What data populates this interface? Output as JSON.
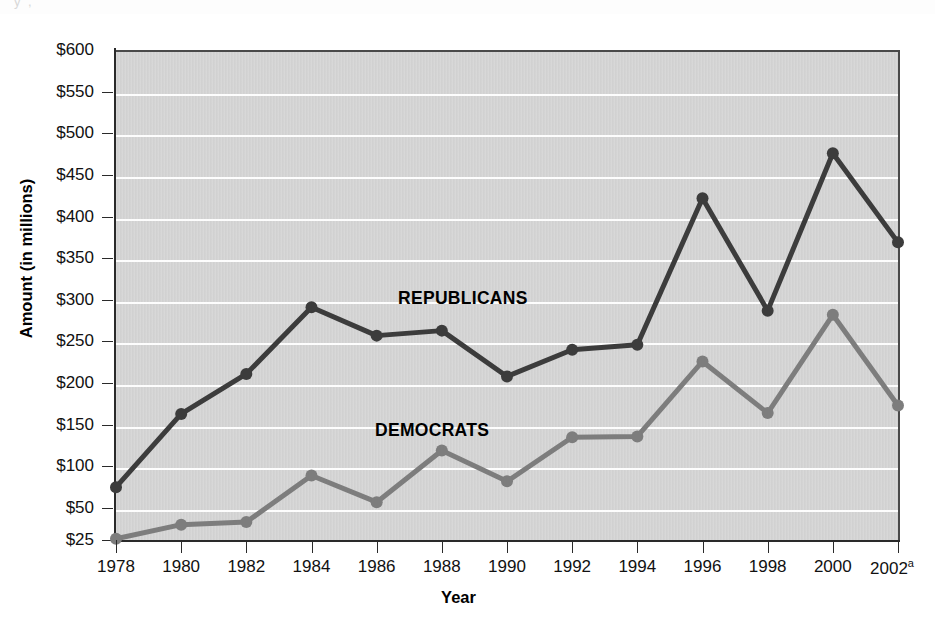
{
  "artifact_text": "y      ,",
  "axes": {
    "y_title": "Amount (in millions)",
    "x_title": "Year",
    "y_tick_labels": [
      "$600",
      "$550",
      "$500",
      "$450",
      "$400",
      "$350",
      "$300",
      "$250",
      "$200",
      "$150",
      "$100",
      "$50",
      "$25"
    ],
    "x_tick_labels": [
      "1978",
      "1980",
      "1982",
      "1984",
      "1986",
      "1988",
      "1990",
      "1992",
      "1994",
      "1996",
      "1998",
      "2000",
      "2002"
    ],
    "x_last_superscript": "a"
  },
  "annotations": [
    {
      "name": "republicans-label",
      "text": "REPUBLICANS",
      "x": 398,
      "y": 288
    },
    {
      "name": "democrats-label",
      "text": "DEMOCRATS",
      "x": 375,
      "y": 420
    }
  ],
  "colors": {
    "republican_line": "#3c3c3c",
    "democrat_line": "#7d7d7d",
    "plot_background": "#d3d3d3",
    "gridline": "#fdfdfd",
    "axis": "#2a2a2a",
    "text": "#111111"
  },
  "chart_data": {
    "type": "line",
    "title": "",
    "subtitle": "",
    "xlabel": "Year",
    "ylabel": "Amount (in millions)",
    "x": [
      1978,
      1980,
      1982,
      1984,
      1986,
      1988,
      1990,
      1992,
      1994,
      1996,
      1998,
      2000,
      2002
    ],
    "categories": [
      "1978",
      "1980",
      "1982",
      "1984",
      "1986",
      "1988",
      "1990",
      "1992",
      "1994",
      "1996",
      "1998",
      "2000",
      "2002a"
    ],
    "series": [
      {
        "name": "REPUBLICANS",
        "color": "#3c3c3c",
        "values": [
          75,
          163,
          211,
          291,
          257,
          263,
          208,
          240,
          246,
          422,
          287,
          476,
          369
        ]
      },
      {
        "name": "DEMOCRATS",
        "color": "#7d7d7d",
        "values": [
          26,
          37,
          39,
          89,
          57,
          119,
          82,
          135,
          136,
          226,
          164,
          282,
          173
        ]
      }
    ],
    "ylim": [
      0,
      600
    ],
    "y_ticks": [
      600,
      550,
      500,
      450,
      400,
      350,
      300,
      250,
      200,
      150,
      100,
      50,
      25
    ],
    "y_tick_format": "$",
    "xlim": [
      1978,
      2002
    ],
    "grid": true,
    "grid_axis": "y",
    "legend": "inline-annotations",
    "markers": true,
    "footnote_marker": "a"
  }
}
